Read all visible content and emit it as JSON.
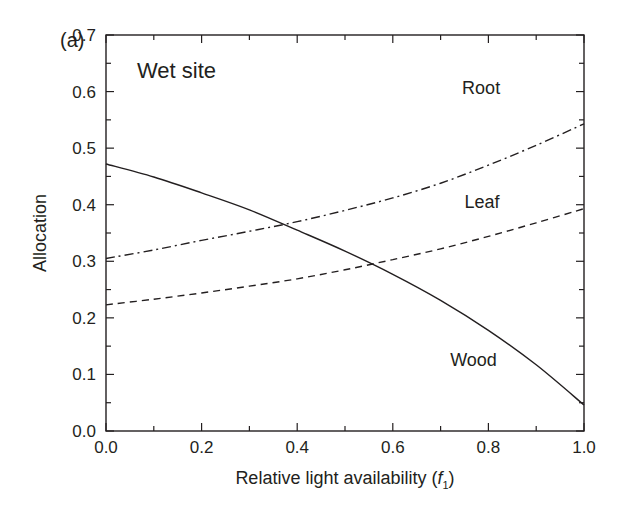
{
  "chart_data": {
    "type": "line",
    "panel_label": "(a)",
    "annotation": "Wet site",
    "xlabel": "Relative light availability (f1)",
    "xlabel_parts": {
      "prefix": "Relative light availability (",
      "var": "f",
      "sub": "1",
      "suffix": ")"
    },
    "ylabel": "Allocation",
    "xlim": [
      0.0,
      1.0
    ],
    "ylim": [
      0.0,
      0.7
    ],
    "xticks": [
      "0.0",
      "0.2",
      "0.4",
      "0.6",
      "0.8",
      "1.0"
    ],
    "yticks": [
      "0.0",
      "0.1",
      "0.2",
      "0.3",
      "0.4",
      "0.5",
      "0.6",
      "0.7"
    ],
    "grid": false,
    "legend": "inline labels",
    "x": [
      0.0,
      0.1,
      0.2,
      0.3,
      0.4,
      0.5,
      0.6,
      0.7,
      0.8,
      0.9,
      1.0
    ],
    "series": [
      {
        "name": "Root",
        "style": "dash-dot",
        "values": [
          0.305,
          0.32,
          0.337,
          0.353,
          0.37,
          0.39,
          0.412,
          0.438,
          0.47,
          0.505,
          0.543
        ],
        "label_pos": [
          0.745,
          0.595
        ]
      },
      {
        "name": "Leaf",
        "style": "dashed",
        "values": [
          0.223,
          0.233,
          0.244,
          0.256,
          0.269,
          0.285,
          0.303,
          0.322,
          0.344,
          0.368,
          0.393
        ],
        "label_pos": [
          0.75,
          0.395
        ]
      },
      {
        "name": "Wood",
        "style": "solid",
        "values": [
          0.472,
          0.449,
          0.421,
          0.391,
          0.355,
          0.318,
          0.277,
          0.231,
          0.178,
          0.117,
          0.046
        ],
        "label_pos": [
          0.72,
          0.115
        ]
      }
    ]
  },
  "colors": {
    "line": "#231f20",
    "background": "#ffffff"
  }
}
